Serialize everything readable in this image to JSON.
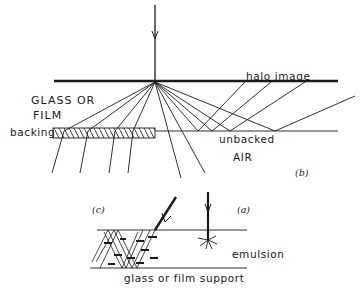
{
  "diagram": {
    "labels": {
      "glass_or_film_line1": "GLASS OR",
      "glass_or_film_line2": "FILM",
      "halo_image": "halo  image",
      "backing": "backing",
      "unbacked": "unbacked",
      "air": "AIR",
      "panel_b": "(b)",
      "panel_c": "(c)",
      "panel_a": "(a)",
      "emulsion": "emulsion",
      "support": "glass or film  support"
    },
    "colors": {
      "ink": "#1a1a1a",
      "background": "#ffffff"
    }
  }
}
